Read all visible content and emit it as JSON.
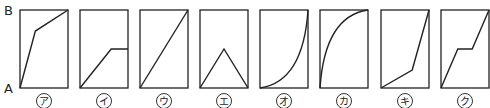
{
  "axis": {
    "top_label": "B",
    "bottom_label": "A"
  },
  "box": {
    "y_top": 10,
    "y_bottom": 88,
    "width": 48,
    "stroke": "#222222"
  },
  "graphs": [
    {
      "label": "ア",
      "x": 20,
      "type": "polyline",
      "points": [
        [
          0,
          1
        ],
        [
          0.32,
          0.27
        ],
        [
          1,
          0
        ]
      ]
    },
    {
      "label": "イ",
      "x": 80,
      "type": "polyline",
      "points": [
        [
          0,
          1
        ],
        [
          0.65,
          0.5
        ],
        [
          1,
          0.5
        ]
      ]
    },
    {
      "label": "ウ",
      "x": 140,
      "type": "polyline",
      "points": [
        [
          0,
          1
        ],
        [
          1,
          0
        ]
      ]
    },
    {
      "label": "エ",
      "x": 200,
      "type": "polyline",
      "points": [
        [
          0,
          1
        ],
        [
          0.5,
          0.5
        ],
        [
          1,
          1
        ]
      ]
    },
    {
      "label": "オ",
      "x": 260,
      "type": "curve-concave-up"
    },
    {
      "label": "カ",
      "x": 320,
      "type": "curve-concave-down"
    },
    {
      "label": "キ",
      "x": 381,
      "type": "polyline",
      "points": [
        [
          0,
          1
        ],
        [
          0.65,
          0.77
        ],
        [
          1,
          0
        ]
      ]
    },
    {
      "label": "ク",
      "x": 441,
      "type": "polyline",
      "points": [
        [
          0,
          1
        ],
        [
          0.35,
          0.5
        ],
        [
          0.65,
          0.5
        ],
        [
          1,
          0
        ]
      ]
    }
  ]
}
